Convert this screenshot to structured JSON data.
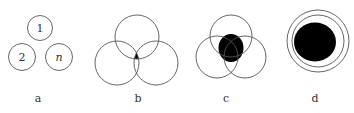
{
  "panels": [
    {
      "id": "a",
      "label": "a",
      "circle_labels": [
        "1",
        "2",
        "n"
      ]
    },
    {
      "id": "b",
      "label": "b"
    },
    {
      "id": "c",
      "label": "c"
    },
    {
      "id": "d",
      "label": "d"
    }
  ],
  "colors": {
    "stroke": "#555555",
    "fill": "#000000",
    "background": "#ffffff"
  }
}
